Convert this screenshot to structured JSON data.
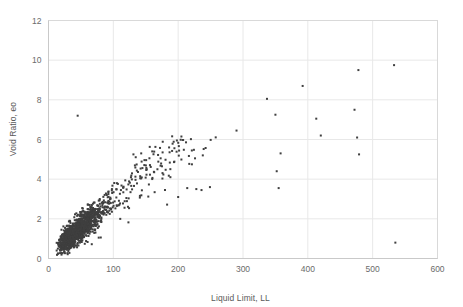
{
  "chart": {
    "type": "scatter",
    "title": "",
    "xlabel": "Liquid Limit, LL",
    "ylabel": "Void Ratio, eo",
    "marker_color": "#3f3f3f",
    "grid_color": "#e8e8e8",
    "axis_color": "#d9d9d9",
    "tick_label_color": "#6b6b6b"
  },
  "axes": {
    "x_ticks": [
      "0",
      "100",
      "200",
      "300",
      "400",
      "500",
      "600"
    ],
    "y_ticks": [
      "0",
      "2",
      "4",
      "6",
      "8",
      "10",
      "12"
    ]
  },
  "chart_data": {
    "type": "scatter",
    "title": "",
    "xlabel": "Liquid Limit, LL",
    "ylabel": "Void Ratio, eo",
    "xlim": [
      0,
      600
    ],
    "ylim": [
      0,
      12
    ],
    "xticks": [
      0,
      100,
      200,
      300,
      400,
      500,
      600
    ],
    "yticks": [
      0,
      2,
      4,
      6,
      8,
      10,
      12
    ],
    "grid": true,
    "legend": "none",
    "series": [
      {
        "name": "Soil samples",
        "marker": "square",
        "marker_size": 2,
        "color": "#3f3f3f",
        "note": "Dense positively-correlated cloud for LL 15-200 plus sparse high-LL outliers",
        "outliers": [
          [
            45,
            7.2
          ],
          [
            290,
            6.45
          ],
          [
            337,
            8.05
          ],
          [
            350,
            7.25
          ],
          [
            355,
            3.55
          ],
          [
            352,
            4.4
          ],
          [
            358,
            5.3
          ],
          [
            392,
            8.7
          ],
          [
            413,
            7.05
          ],
          [
            420,
            6.2
          ],
          [
            472,
            7.5
          ],
          [
            476,
            6.1
          ],
          [
            478,
            9.5
          ],
          [
            479,
            5.25
          ],
          [
            533,
            9.75
          ],
          [
            535,
            0.8
          ],
          [
            238,
            5.2
          ],
          [
            226,
            5.05
          ],
          [
            205,
            6.15
          ],
          [
            198,
            5.95
          ],
          [
            186,
            5.6
          ],
          [
            176,
            5.35
          ],
          [
            160,
            5.4
          ],
          [
            143,
            5.3
          ],
          [
            131,
            5.25
          ],
          [
            249,
            3.6
          ],
          [
            236,
            3.45
          ],
          [
            228,
            3.5
          ],
          [
            214,
            3.55
          ],
          [
            200,
            3.1
          ],
          [
            175,
            4.65
          ],
          [
            168,
            4.5
          ],
          [
            188,
            4.1
          ],
          [
            163,
            4.35
          ],
          [
            20,
            1.45
          ]
        ],
        "cluster": {
          "n_points": 1400,
          "x_range": [
            12,
            200
          ],
          "y_range": [
            0.2,
            5.2
          ],
          "x_mode": 45,
          "trend": "y rises roughly linearly with x; slope about 0.028, intercept about 0.15",
          "scatter_sd": 0.38
        }
      }
    ]
  }
}
